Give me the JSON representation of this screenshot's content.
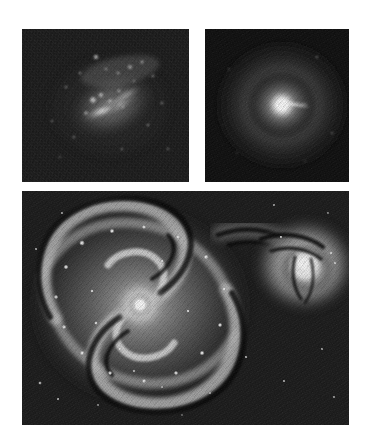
{
  "figure": {
    "background_color": "#ffffff",
    "width": 365,
    "height": 439,
    "colormap": "grayscale",
    "panel_count": 3
  },
  "panels": [
    {
      "id": "irregular",
      "position": "top-left",
      "subject": "irregular dwarf starburst galaxy",
      "description": "Elongated bright bar oriented upper-right to lower-left with scattered bright star-forming knots above the bar, set in a noisy dark sky background.",
      "frame": {
        "x": 22,
        "y": 29,
        "width": 167,
        "height": 153
      },
      "background_color": "#141414",
      "core_color": "#e8e8e8",
      "features": [
        "diagonal luminous bar",
        "resolved bright knots",
        "clumpy outer halo",
        "high background noise"
      ],
      "label": ""
    },
    {
      "id": "elliptical",
      "position": "top-right",
      "subject": "elliptical galaxy with nuclear jet",
      "description": "Smooth, centrally concentrated round elliptical galaxy with a very bright unresolved core and a thin linear jet streak extending to the right of the nucleus.",
      "frame": {
        "x": 205,
        "y": 29,
        "width": 144,
        "height": 153
      },
      "background_color": "#0d0d0d",
      "core_color": "#ffffff",
      "features": [
        "smooth symmetric halo",
        "saturated bright nucleus",
        "narrow linear jet to the east",
        "no spiral structure"
      ],
      "label": ""
    },
    {
      "id": "spiral",
      "position": "bottom",
      "subject": "grand-design spiral galaxy with interacting companion",
      "description": "Face-on grand-design spiral with two prominent arms traced by bright HII knots and dark dust lanes, a bright compact nucleus, and a tidally interacting companion galaxy at the upper right connected by a bridge of material.",
      "frame": {
        "x": 22,
        "y": 191,
        "width": 327,
        "height": 234
      },
      "background_color": "#1a1a1a",
      "core_color": "#f2f2f2",
      "features": [
        "two-armed grand design spiral",
        "bright nucleus",
        "dust lanes along inner arms",
        "bright star-forming knots",
        "tidal bridge to companion",
        "companion galaxy with dust lanes"
      ],
      "label": ""
    }
  ]
}
